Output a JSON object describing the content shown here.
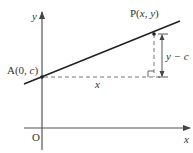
{
  "diagram": {
    "type": "coordinate-geometry",
    "axes": {
      "x_label": "x",
      "y_label": "y",
      "origin_label": "O"
    },
    "points": {
      "A": {
        "name": "A",
        "label_prefix": "A(0, ",
        "label_var": "c",
        "label_suffix": ")"
      },
      "P": {
        "name": "P",
        "label_prefix": "P(",
        "label_x": "x",
        "label_sep": ", ",
        "label_y": "y",
        "label_suffix": ")"
      }
    },
    "measurements": {
      "horizontal_label": "x",
      "vertical_label": "y − c"
    },
    "colors": {
      "line": "#222222",
      "axis": "#555555",
      "dashed": "#666666",
      "text": "#333333"
    }
  }
}
